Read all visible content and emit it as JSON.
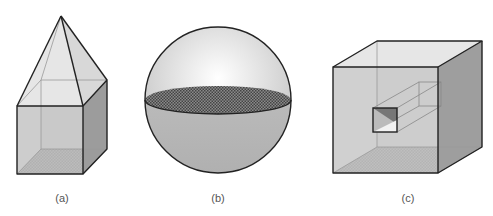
{
  "figures": [
    {
      "id": "a",
      "label": "(a)",
      "shape": "square prism with pyramid top"
    },
    {
      "id": "b",
      "label": "(b)",
      "shape": "sphere with shaded equatorial disc"
    },
    {
      "id": "c",
      "label": "(c)",
      "shape": "cube with square tunnel"
    }
  ],
  "colors": {
    "stroke": "#222222",
    "face_light": "#e4e4e4",
    "face_mid": "#c8c8c8",
    "face_dark": "#9a9a9a",
    "floor_hatch": "#555555"
  }
}
